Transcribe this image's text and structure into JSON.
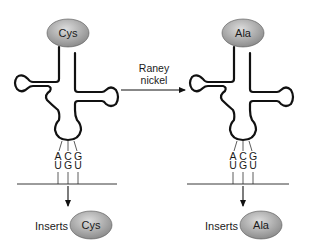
{
  "diagram": {
    "left_trna": {
      "amino_acid": "Cys",
      "anticodon": [
        "A",
        "C",
        "G"
      ],
      "codon": [
        "U",
        "G",
        "U"
      ],
      "inserts_label": "Inserts",
      "inserted_amino_acid": "Cys"
    },
    "reaction": {
      "reagent_line1": "Raney",
      "reagent_line2": "nickel"
    },
    "right_trna": {
      "amino_acid": "Ala",
      "anticodon": [
        "A",
        "C",
        "G"
      ],
      "codon": [
        "U",
        "G",
        "U"
      ],
      "inserts_label": "Inserts",
      "inserted_amino_acid": "Ala"
    },
    "colors": {
      "ellipse_light": "#d8d8d8",
      "ellipse_dark": "#8a8a8a",
      "line": "#111111"
    }
  }
}
